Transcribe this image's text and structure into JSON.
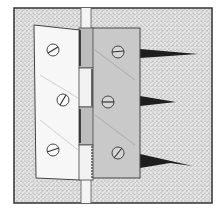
{
  "figure": {
    "colors": {
      "background": "#ffffff",
      "surface_stipple": "#dcdcdc",
      "frame_border": "#333333",
      "gap": "#f4f4f4",
      "left_leaf": "#f7f7f7",
      "right_leaf": "#c9c9c9",
      "knuckle_dark": "#b9b9b9",
      "outline": "#444444",
      "split": "#1e1e1e"
    },
    "screws": {
      "left_leaf": [
        {
          "cx": 53,
          "cy": 50
        },
        {
          "cx": 63,
          "cy": 100
        },
        {
          "cx": 53,
          "cy": 150
        }
      ],
      "right_leaf": [
        {
          "cx": 118,
          "cy": 52
        },
        {
          "cx": 108,
          "cy": 102
        },
        {
          "cx": 118,
          "cy": 153
        }
      ]
    },
    "splits": [
      {
        "y": 53,
        "length": 58
      },
      {
        "y": 101,
        "length": 35
      },
      {
        "y": 161,
        "length": 52
      }
    ]
  }
}
